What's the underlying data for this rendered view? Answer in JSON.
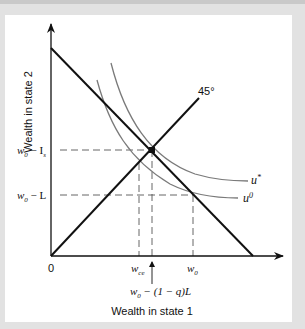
{
  "diagram": {
    "y_axis_label": "Wealth in state 2",
    "x_axis_label": "Wealth in state 1",
    "origin_label": "0",
    "line_45_label": "45°",
    "curves": [
      {
        "name": "u*",
        "label_base": "u",
        "label_sup": "*"
      },
      {
        "name": "u0",
        "label_base": "u",
        "label_sup": "0"
      }
    ],
    "y_ticks": [
      {
        "id": "w0_minus_Is",
        "base": "w",
        "sub": "0",
        "rest": " − I",
        "rest_sub": "s"
      },
      {
        "id": "w0_minus_L",
        "base": "w",
        "sub": "0",
        "rest": " − L"
      }
    ],
    "x_ticks": [
      {
        "id": "wce",
        "base": "w",
        "sub": "ce"
      },
      {
        "id": "w0",
        "base": "w",
        "sub": "0"
      }
    ],
    "x_arrow_annotation": {
      "base": "w",
      "sub": "0",
      "rest": " − (1 − q)L"
    },
    "colors": {
      "axis": "#111111",
      "budget_line": "#111111",
      "indifference_curves": "#7a7a7a",
      "dashed_guides": "#555555",
      "background": "#ffffff",
      "frame": "#e2e2e2"
    }
  }
}
